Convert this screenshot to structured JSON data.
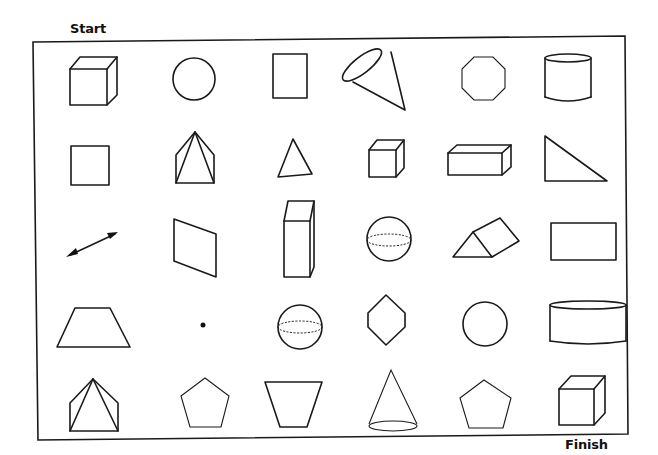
{
  "worksheet": {
    "start_label": "Start",
    "finish_label": "Finish",
    "ink_color": "#1a1a1a",
    "background_color": "#ffffff",
    "grid": {
      "rows": 5,
      "columns": 6,
      "cells": [
        [
          "cube",
          "circle",
          "rectangle",
          "cone",
          "octagon",
          "cylinder"
        ],
        [
          "square",
          "pyramid",
          "triangle",
          "cube",
          "rectangular-prism",
          "right-triangle"
        ],
        [
          "line-segment-arrow",
          "parallelogram",
          "rectangular-prism",
          "sphere",
          "triangular-prism",
          "rectangle"
        ],
        [
          "trapezoid",
          "point",
          "sphere",
          "hexagon",
          "circle",
          "cylinder"
        ],
        [
          "pyramid",
          "pentagon",
          "trapezoid",
          "cone",
          "pentagon",
          "cube"
        ]
      ]
    }
  }
}
